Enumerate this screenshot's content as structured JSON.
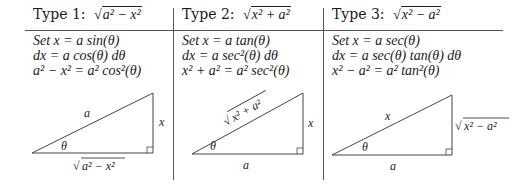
{
  "columns": [
    {
      "title_prefix": "Type 1:",
      "title_radicand": "a² − x²",
      "substitution": "Set x = a sin(θ)",
      "differential": "dx = a cos(θ) dθ",
      "identity": "a² − x² = a² cos²(θ)",
      "triangle": {
        "hypotenuse_label": "a",
        "opposite_label": "x",
        "adjacent_label": "√(a² − x²)",
        "adjacent_radicand": "a² − x²",
        "angle_label": "θ"
      }
    },
    {
      "title_prefix": "Type 2:",
      "title_radicand": "x² + a²",
      "substitution": "Set x = a tan(θ)",
      "differential": "dx = a sec²(θ) dθ",
      "identity": "x² + a² = a² sec²(θ)",
      "triangle": {
        "hypotenuse_label": "√(x² + a²)",
        "hypotenuse_radicand": "x² + a²",
        "opposite_label": "x",
        "adjacent_label": "a",
        "angle_label": "θ"
      }
    },
    {
      "title_prefix": "Type 3:",
      "title_radicand": "x² − a²",
      "substitution": "Set x = a sec(θ)",
      "differential": "dx = a sec(θ) tan(θ) dθ",
      "identity": "x² − a² = a² tan²(θ)",
      "triangle": {
        "hypotenuse_label": "x",
        "opposite_label": "√(x² − a²)",
        "opposite_radicand": "x² − a²",
        "adjacent_label": "a",
        "angle_label": "θ"
      }
    }
  ]
}
